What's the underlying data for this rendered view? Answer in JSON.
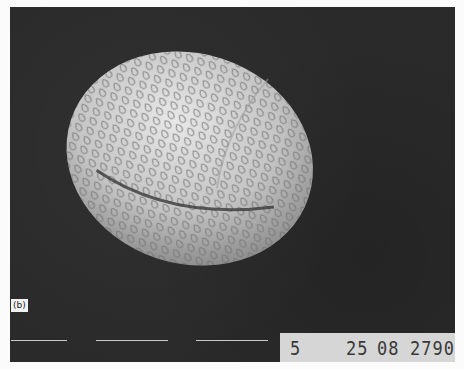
{
  "figure": {
    "panel_label": "(b)",
    "databar": {
      "field1": "5",
      "field2": "25",
      "field3": "08",
      "field4": "2790"
    },
    "scale_bars_count": 3,
    "colors": {
      "background": "#2a2a2a",
      "databar": "#d6d6d6",
      "grain": "#d8d8d8"
    }
  }
}
